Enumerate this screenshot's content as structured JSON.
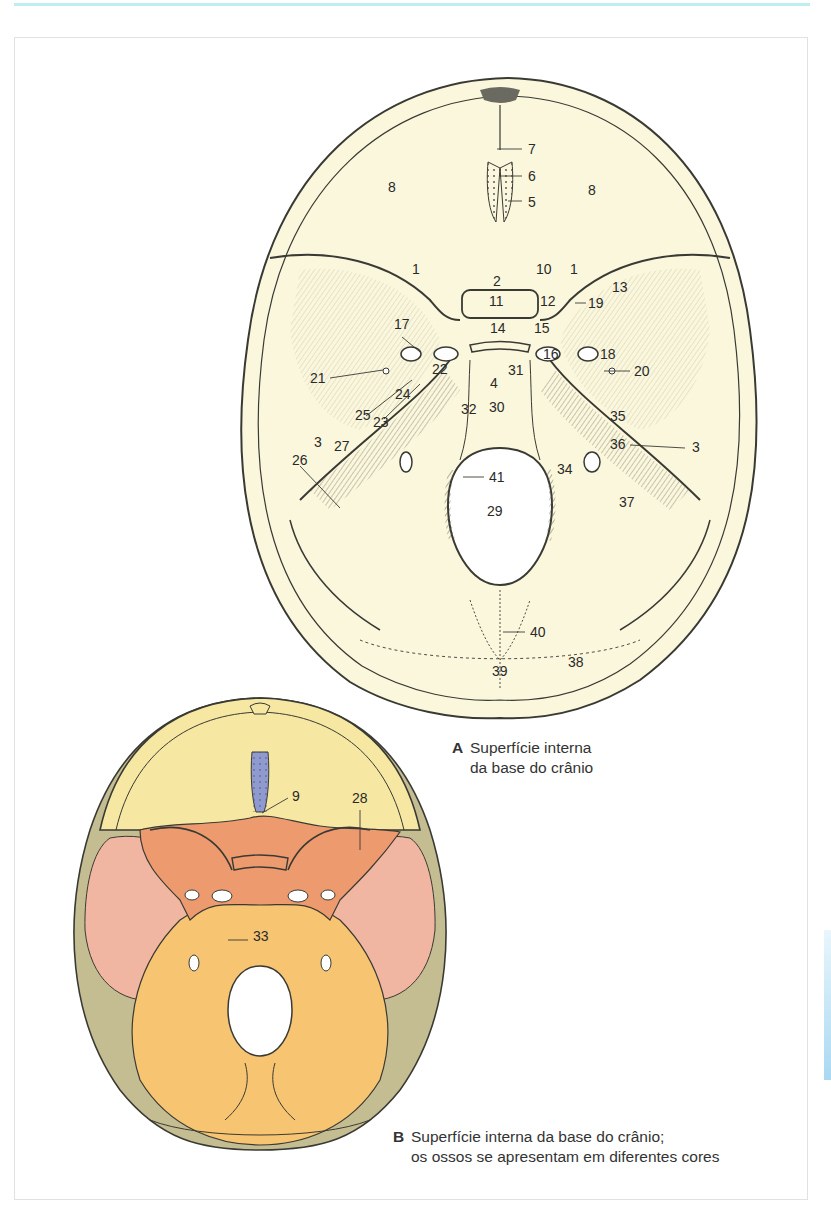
{
  "figure_a": {
    "caption_letter": "A",
    "caption_line1": "Superfície interna",
    "caption_line2": "da base do crânio",
    "labels": [
      {
        "id": "1",
        "x": 412,
        "y": 274
      },
      {
        "id": "1",
        "x": 570,
        "y": 274
      },
      {
        "id": "2",
        "x": 493,
        "y": 286
      },
      {
        "id": "3",
        "x": 314,
        "y": 447
      },
      {
        "id": "3",
        "x": 692,
        "y": 452
      },
      {
        "id": "4",
        "x": 490,
        "y": 388
      },
      {
        "id": "5",
        "x": 528,
        "y": 207
      },
      {
        "id": "6",
        "x": 528,
        "y": 181
      },
      {
        "id": "7",
        "x": 528,
        "y": 154
      },
      {
        "id": "8",
        "x": 388,
        "y": 192
      },
      {
        "id": "8",
        "x": 588,
        "y": 195
      },
      {
        "id": "10",
        "x": 536,
        "y": 274
      },
      {
        "id": "11",
        "x": 489,
        "y": 306
      },
      {
        "id": "12",
        "x": 540,
        "y": 306
      },
      {
        "id": "13",
        "x": 612,
        "y": 292
      },
      {
        "id": "14",
        "x": 490,
        "y": 333
      },
      {
        "id": "15",
        "x": 534,
        "y": 333
      },
      {
        "id": "16",
        "x": 543,
        "y": 359
      },
      {
        "id": "17",
        "x": 394,
        "y": 329
      },
      {
        "id": "18",
        "x": 600,
        "y": 359
      },
      {
        "id": "19",
        "x": 588,
        "y": 308
      },
      {
        "id": "20",
        "x": 634,
        "y": 376
      },
      {
        "id": "21",
        "x": 310,
        "y": 383
      },
      {
        "id": "22",
        "x": 432,
        "y": 374
      },
      {
        "id": "23",
        "x": 373,
        "y": 427
      },
      {
        "id": "24",
        "x": 395,
        "y": 399
      },
      {
        "id": "25",
        "x": 355,
        "y": 420
      },
      {
        "id": "26",
        "x": 292,
        "y": 465
      },
      {
        "id": "27",
        "x": 334,
        "y": 451
      },
      {
        "id": "29",
        "x": 487,
        "y": 516
      },
      {
        "id": "30",
        "x": 489,
        "y": 412
      },
      {
        "id": "31",
        "x": 508,
        "y": 375
      },
      {
        "id": "32",
        "x": 461,
        "y": 414
      },
      {
        "id": "34",
        "x": 557,
        "y": 474
      },
      {
        "id": "35",
        "x": 610,
        "y": 421
      },
      {
        "id": "36",
        "x": 610,
        "y": 449
      },
      {
        "id": "37",
        "x": 619,
        "y": 507
      },
      {
        "id": "38",
        "x": 568,
        "y": 667
      },
      {
        "id": "39",
        "x": 492,
        "y": 676
      },
      {
        "id": "40",
        "x": 530,
        "y": 637
      },
      {
        "id": "41",
        "x": 489,
        "y": 482
      }
    ]
  },
  "figure_b": {
    "caption_letter": "B",
    "caption_line1": "Superfície interna da base do crânio;",
    "caption_line2": "os ossos se apresentam em diferentes cores",
    "labels": [
      {
        "id": "9",
        "x": 292,
        "y": 801
      },
      {
        "id": "28",
        "x": 352,
        "y": 803
      },
      {
        "id": "33",
        "x": 253,
        "y": 941
      }
    ],
    "bone_colors": {
      "frontal": "#f6e7a2",
      "ethmoid": "#8e9ad0",
      "sphenoid": "#ed9a6e",
      "temporal": "#f1b6a2",
      "parietal": "#c5bd92",
      "occipital": "#f7c472"
    }
  },
  "colors": {
    "drawing_fill": "#fbf7dc",
    "line": "#3a3a34",
    "accent_rule": "#bdeef2"
  }
}
